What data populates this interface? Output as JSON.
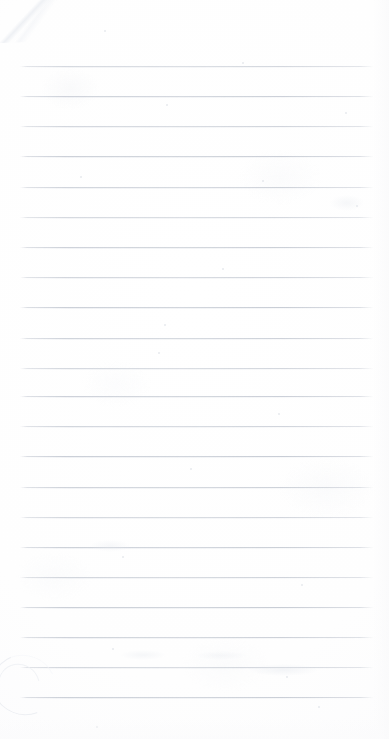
{
  "document": {
    "kind": "scanned-lined-notebook-page",
    "title": "Blank Lined Notebook Page",
    "orientation": "portrait",
    "width_px": 389,
    "height_px": 739,
    "text_content": "",
    "has_visible_text": false,
    "has_handwriting": false,
    "page_background_color": "#fefefe",
    "rule_color": "#c9ced6",
    "rule_color_faint": "#e4e7ec"
  },
  "ruling": {
    "style": "horizontal-ruled",
    "line_count": 22,
    "first_line_y": 66,
    "line_spacing_px": 30.1,
    "line_left_x": 20,
    "line_right_x": 374,
    "line_thickness_px": 1,
    "margin_rule_present": false,
    "top_margin_px": 66,
    "bottom_margin_px": 42,
    "lines_y": [
      66,
      96,
      126,
      156,
      187,
      217,
      247,
      277,
      307,
      338,
      368,
      396,
      426,
      456,
      487,
      517,
      547,
      577,
      607,
      637,
      667,
      697
    ]
  },
  "artifacts": {
    "items": [
      {
        "name": "corner-fold-crease",
        "position": "top-left",
        "x": -6,
        "y": -10
      },
      {
        "name": "curved-smudge",
        "position": "bottom-left",
        "x": -8,
        "y": 655
      }
    ],
    "specks": [
      {
        "x": 104,
        "y": 30,
        "size": 2
      },
      {
        "x": 242,
        "y": 62,
        "size": 2
      },
      {
        "x": 166,
        "y": 104,
        "size": 2
      },
      {
        "x": 345,
        "y": 112,
        "size": 2
      },
      {
        "x": 80,
        "y": 176,
        "size": 2
      },
      {
        "x": 262,
        "y": 180,
        "size": 2
      },
      {
        "x": 356,
        "y": 205,
        "size": 2
      },
      {
        "x": 222,
        "y": 268,
        "size": 2
      },
      {
        "x": 164,
        "y": 324,
        "size": 2
      },
      {
        "x": 158,
        "y": 352,
        "size": 2
      },
      {
        "x": 278,
        "y": 413,
        "size": 2
      },
      {
        "x": 190,
        "y": 468,
        "size": 2
      },
      {
        "x": 122,
        "y": 556,
        "size": 2
      },
      {
        "x": 301,
        "y": 584,
        "size": 2
      },
      {
        "x": 112,
        "y": 648,
        "size": 2
      },
      {
        "x": 286,
        "y": 676,
        "size": 2
      },
      {
        "x": 318,
        "y": 706,
        "size": 2
      },
      {
        "x": 96,
        "y": 726,
        "size": 2
      }
    ],
    "smudges": [
      {
        "x": 248,
        "y": 664,
        "w": 70,
        "h": 12,
        "opacity": 0.5
      },
      {
        "x": 120,
        "y": 650,
        "w": 46,
        "h": 10,
        "opacity": 0.4
      },
      {
        "x": 195,
        "y": 651,
        "w": 52,
        "h": 9,
        "opacity": 0.35
      },
      {
        "x": 330,
        "y": 195,
        "w": 34,
        "h": 16,
        "opacity": 0.4
      },
      {
        "x": 90,
        "y": 540,
        "w": 40,
        "h": 12,
        "opacity": 0.35
      }
    ]
  }
}
